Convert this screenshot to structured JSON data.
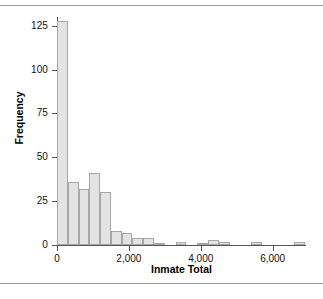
{
  "chart_data": {
    "type": "bar",
    "title": "",
    "subtitle": "",
    "xlabel": "Inmate Total",
    "ylabel": "Frequency",
    "xlim": [
      0,
      6900
    ],
    "ylim": [
      0,
      130
    ],
    "bin_width": 300,
    "grid": false,
    "legend": null,
    "xticks": [
      0,
      2000,
      4000,
      6000
    ],
    "xtick_labels": [
      "0",
      "2,000",
      "4,000",
      "6,000"
    ],
    "yticks": [
      0,
      25,
      50,
      75,
      100,
      125
    ],
    "ytick_labels": [
      "0",
      "25",
      "50",
      "75",
      "100",
      "125"
    ],
    "bin_starts": [
      0,
      300,
      600,
      900,
      1200,
      1500,
      1800,
      2100,
      2400,
      2700,
      3000,
      3300,
      3600,
      3900,
      4200,
      4500,
      4800,
      5100,
      5400,
      5700,
      6000,
      6300,
      6600
    ],
    "categories": [
      "0-300",
      "300-600",
      "600-900",
      "900-1200",
      "1200-1500",
      "1500-1800",
      "1800-2100",
      "2100-2400",
      "2400-2700",
      "2700-3000",
      "3000-3300",
      "3300-3600",
      "3600-3900",
      "3900-4200",
      "4200-4500",
      "4500-4800",
      "4800-5100",
      "5100-5400",
      "5400-5700",
      "5700-6000",
      "6000-6300",
      "6300-6600",
      "6600-6900"
    ],
    "values": [
      128,
      36,
      32,
      41,
      30,
      8,
      7,
      4,
      4,
      1,
      0,
      2,
      0,
      1,
      3,
      2,
      0,
      0,
      2,
      0,
      0,
      0,
      2
    ],
    "bar_fill_color": "#e3e3e3",
    "bar_edge_color": "#a6a6a6",
    "axis_color": "#555555",
    "text_color": "#111111",
    "background_color": "#ffffff"
  },
  "figure": {
    "top_rule_color": "#9a9a9a",
    "bottom_rule_color": "#9a9a9a"
  }
}
